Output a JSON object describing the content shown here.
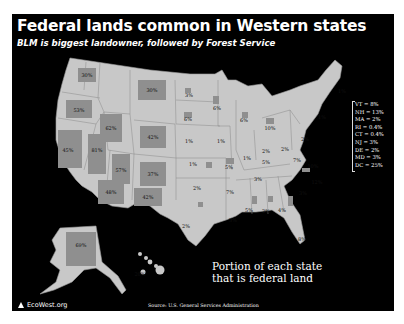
{
  "header": {
    "title": "Federal lands common in Western states",
    "subtitle": "BLM is biggest landowner, followed by Forest Service"
  },
  "colors": {
    "background": "#000000",
    "border": "#ffffff",
    "state_fill": "#c8c8c8",
    "federal_fill": "#8f8f8f",
    "text": "#ffffff"
  },
  "states": [
    {
      "abbr": "WA",
      "value": "30%"
    },
    {
      "abbr": "OR",
      "value": "53%"
    },
    {
      "abbr": "ID",
      "value": "62%"
    },
    {
      "abbr": "MT",
      "value": "30%"
    },
    {
      "abbr": "WY",
      "value": "42%"
    },
    {
      "abbr": "CA",
      "value": "45%"
    },
    {
      "abbr": "NV",
      "value": "81%"
    },
    {
      "abbr": "UT",
      "value": "57%"
    },
    {
      "abbr": "CO",
      "value": "37%"
    },
    {
      "abbr": "AZ",
      "value": "48%"
    },
    {
      "abbr": "NM",
      "value": "42%"
    },
    {
      "abbr": "ND",
      "value": "3%"
    },
    {
      "abbr": "SD",
      "value": "6%"
    },
    {
      "abbr": "NE",
      "value": "1%"
    },
    {
      "abbr": "KS",
      "value": "1%"
    },
    {
      "abbr": "OK",
      "value": "2%"
    },
    {
      "abbr": "TX",
      "value": "2%"
    },
    {
      "abbr": "MN",
      "value": "6%"
    },
    {
      "abbr": "IA",
      "value": "1%"
    },
    {
      "abbr": "MO",
      "value": "5%"
    },
    {
      "abbr": "AR",
      "value": "7%"
    },
    {
      "abbr": "LA",
      "value": "3%"
    },
    {
      "abbr": "WI",
      "value": "6%"
    },
    {
      "abbr": "IL",
      "value": "1%"
    },
    {
      "abbr": "MI",
      "value": "10%"
    },
    {
      "abbr": "IN",
      "value": "2%"
    },
    {
      "abbr": "OH",
      "value": "2%"
    },
    {
      "abbr": "KY",
      "value": "5%"
    },
    {
      "abbr": "TN",
      "value": "3%"
    },
    {
      "abbr": "MS",
      "value": "5%"
    },
    {
      "abbr": "AL",
      "value": "2%"
    },
    {
      "abbr": "GA",
      "value": "4%"
    },
    {
      "abbr": "FL",
      "value": "8%"
    },
    {
      "abbr": "SC",
      "value": "3%"
    },
    {
      "abbr": "NC",
      "value": "12%"
    },
    {
      "abbr": "VA",
      "value": "10%"
    },
    {
      "abbr": "WV",
      "value": "7%"
    },
    {
      "abbr": "PA",
      "value": "2%"
    },
    {
      "abbr": "NY",
      "value": "1%"
    },
    {
      "abbr": "ME",
      "value": "1%"
    },
    {
      "abbr": "AK",
      "value": "69%"
    },
    {
      "abbr": "HI",
      "value": "20%"
    }
  ],
  "small_states_legend": [
    "VT = 8%",
    "NH = 13%",
    "MA = 2%",
    "RI = 0.4%",
    "CT = 0.4%",
    "NJ = 3%",
    "DE = 2%",
    "MD = 3%",
    "DC = 25%"
  ],
  "caption": {
    "line1": "Portion of each state",
    "line2": "that is federal land"
  },
  "footer": {
    "logo": "EcoWest.org",
    "source": "Source: U.S. General Services Administration"
  }
}
